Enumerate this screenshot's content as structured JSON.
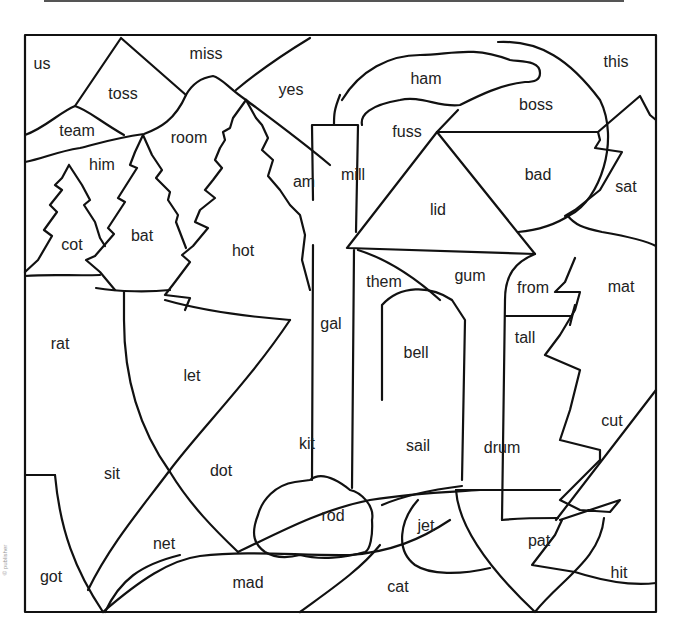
{
  "worksheet": {
    "type": "color-by-word picture",
    "words": [
      {
        "id": "us",
        "text": "us",
        "x": 42,
        "y": 65
      },
      {
        "id": "miss",
        "text": "miss",
        "x": 206,
        "y": 55
      },
      {
        "id": "toss",
        "text": "toss",
        "x": 123,
        "y": 95
      },
      {
        "id": "yes",
        "text": "yes",
        "x": 291,
        "y": 91
      },
      {
        "id": "team",
        "text": "team",
        "x": 77,
        "y": 132
      },
      {
        "id": "room",
        "text": "room",
        "x": 189,
        "y": 139
      },
      {
        "id": "him",
        "text": "him",
        "x": 102,
        "y": 166
      },
      {
        "id": "am",
        "text": "am",
        "x": 304,
        "y": 183
      },
      {
        "id": "cot",
        "text": "cot",
        "x": 72,
        "y": 246
      },
      {
        "id": "bat",
        "text": "bat",
        "x": 142,
        "y": 237
      },
      {
        "id": "hot",
        "text": "hot",
        "x": 243,
        "y": 252
      },
      {
        "id": "ham",
        "text": "ham",
        "x": 426,
        "y": 80
      },
      {
        "id": "this",
        "text": "this",
        "x": 616,
        "y": 63
      },
      {
        "id": "boss",
        "text": "boss",
        "x": 536,
        "y": 106
      },
      {
        "id": "fuss",
        "text": "fuss",
        "x": 407,
        "y": 133
      },
      {
        "id": "mill",
        "text": "mill",
        "x": 353,
        "y": 176
      },
      {
        "id": "bad",
        "text": "bad",
        "x": 538,
        "y": 176
      },
      {
        "id": "sat",
        "text": "sat",
        "x": 626,
        "y": 188
      },
      {
        "id": "lid",
        "text": "lid",
        "x": 438,
        "y": 211
      },
      {
        "id": "them",
        "text": "them",
        "x": 384,
        "y": 283
      },
      {
        "id": "gum",
        "text": "gum",
        "x": 470,
        "y": 277
      },
      {
        "id": "from",
        "text": "from",
        "x": 533,
        "y": 289
      },
      {
        "id": "mat",
        "text": "mat",
        "x": 621,
        "y": 288
      },
      {
        "id": "gal",
        "text": "gal",
        "x": 331,
        "y": 325
      },
      {
        "id": "rat",
        "text": "rat",
        "x": 60,
        "y": 345
      },
      {
        "id": "tall",
        "text": "tall",
        "x": 525,
        "y": 339
      },
      {
        "id": "bell",
        "text": "bell",
        "x": 416,
        "y": 354
      },
      {
        "id": "let",
        "text": "let",
        "x": 192,
        "y": 377
      },
      {
        "id": "cut",
        "text": "cut",
        "x": 612,
        "y": 422
      },
      {
        "id": "kit",
        "text": "kit",
        "x": 307,
        "y": 445
      },
      {
        "id": "sail",
        "text": "sail",
        "x": 418,
        "y": 447
      },
      {
        "id": "drum",
        "text": "drum",
        "x": 502,
        "y": 449
      },
      {
        "id": "sit",
        "text": "sit",
        "x": 112,
        "y": 475
      },
      {
        "id": "dot",
        "text": "dot",
        "x": 221,
        "y": 472
      },
      {
        "id": "rod",
        "text": "rod",
        "x": 333,
        "y": 517
      },
      {
        "id": "jet",
        "text": "jet",
        "x": 426,
        "y": 527
      },
      {
        "id": "net",
        "text": "net",
        "x": 164,
        "y": 545
      },
      {
        "id": "pat",
        "text": "pat",
        "x": 539,
        "y": 542
      },
      {
        "id": "got",
        "text": "got",
        "x": 51,
        "y": 578
      },
      {
        "id": "mad",
        "text": "mad",
        "x": 248,
        "y": 584
      },
      {
        "id": "hit",
        "text": "hit",
        "x": 619,
        "y": 574
      },
      {
        "id": "cat",
        "text": "cat",
        "x": 398,
        "y": 588
      }
    ]
  },
  "margin_credit": "© publisher"
}
